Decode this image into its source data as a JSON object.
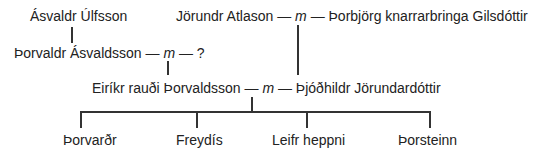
{
  "tree": {
    "row1": {
      "left": "Ásvaldr Úlfsson",
      "right_husband": "Jörundr Atlason",
      "right_sep": "m",
      "right_wife": "Þorbjörg knarrarbringa Gilsdóttir"
    },
    "row2": {
      "husband": "Þorvaldr Ásvaldsson",
      "sep": "m",
      "wife": "?"
    },
    "row3": {
      "husband": "Eiríkr rauði Þorvaldsson",
      "sep": "m",
      "wife": "Þjóðhildr Jörundardóttir"
    },
    "children": [
      "Þorvarðr",
      "Freydís",
      "Leifr heppni",
      "Þorsteinn"
    ],
    "dash": "—",
    "line_color": "#333333",
    "text_color": "#222222"
  }
}
